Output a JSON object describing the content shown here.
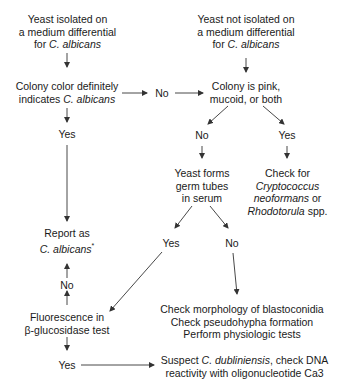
{
  "nodes": {
    "isolated": {
      "line1": "Yeast isolated on",
      "line2": "a medium differential",
      "line3_prefix": "for ",
      "line3_italic": "C. albicans"
    },
    "not_isolated": {
      "line1": "Yeast not isolated on",
      "line2": "a medium differential",
      "line3_prefix": "for ",
      "line3_italic": "C. albicans"
    },
    "colony_color": {
      "line1": "Colony color definitely",
      "line2_prefix": "indicates ",
      "line2_italic": "C. albicans"
    },
    "colony_pink": {
      "line1": "Colony is pink,",
      "line2": "mucoid, or both"
    },
    "germ_tubes": {
      "line1": "Yeast forms",
      "line2": "germ tubes",
      "line3": "in serum"
    },
    "check_crypto": {
      "line1": "Check for",
      "line2_italic": "Cryptococcus",
      "line3_italic": "neoformans",
      "line3_suffix": " or",
      "line4_italic": "Rhodotorula",
      "line4_suffix": " spp."
    },
    "report": {
      "line1": "Report as",
      "line2_italic": "C. albicans",
      "line2_suffix": "*"
    },
    "fluorescence": {
      "line1": "Fluorescence in",
      "line2": "β-glucosidase test"
    },
    "check_morphology": {
      "line1": "Check morphology of blastoconidia",
      "line2": "Check pseudohypha formation",
      "line3": "Perform physiologic tests"
    },
    "suspect_dubliniensis": {
      "line1_prefix": "Suspect ",
      "line1_italic": "C. dubliniensis",
      "line1_suffix": ", check DNA",
      "line2": "reactivity with oligonucleotide Ca3"
    }
  },
  "labels": {
    "color_no": "No",
    "color_yes": "Yes",
    "pink_no": "No",
    "pink_yes": "Yes",
    "germ_yes": "Yes",
    "germ_no": "No",
    "fluor_no": "No",
    "fluor_yes": "Yes"
  },
  "colors": {
    "text": "#1a1a1a",
    "line": "#333333",
    "background": "#ffffff"
  }
}
